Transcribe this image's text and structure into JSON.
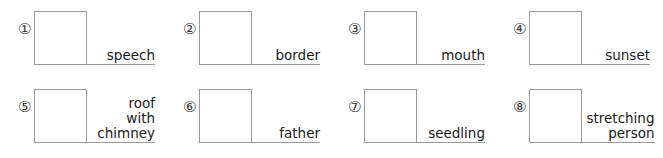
{
  "worksheet": {
    "rows": [
      {
        "items": [
          {
            "number": "①",
            "lines": [
              "speech"
            ]
          },
          {
            "number": "②",
            "lines": [
              "border"
            ]
          },
          {
            "number": "③",
            "lines": [
              "mouth"
            ]
          },
          {
            "number": "④",
            "lines": [
              "sunset"
            ]
          }
        ]
      },
      {
        "items": [
          {
            "number": "⑤",
            "lines": [
              "roof",
              "with",
              "chimney"
            ]
          },
          {
            "number": "⑥",
            "lines": [
              "father"
            ]
          },
          {
            "number": "⑦",
            "lines": [
              "seedling"
            ]
          },
          {
            "number": "⑧",
            "lines": [
              "stretching",
              "person"
            ]
          }
        ]
      }
    ],
    "colors": {
      "background": "#ffffff",
      "rule": "#9a9a9a",
      "box_border": "#9a9a9a",
      "text": "#1a1a1a",
      "number": "#3a3a3a"
    }
  }
}
